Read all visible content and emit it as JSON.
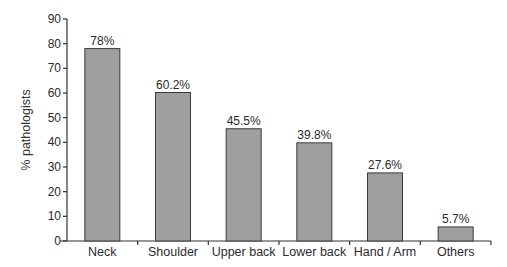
{
  "chart_data": {
    "type": "bar",
    "title": "",
    "xlabel": "",
    "ylabel": "% pathologists",
    "ylim": [
      0,
      90
    ],
    "yticks": [
      0,
      10,
      20,
      30,
      40,
      50,
      60,
      70,
      80,
      90
    ],
    "categories": [
      "Neck",
      "Shoulder",
      "Upper back",
      "Lower back",
      "Hand / Arm",
      "Others"
    ],
    "values": [
      78,
      60.2,
      45.5,
      39.8,
      27.6,
      5.7
    ],
    "data_labels": [
      "78%",
      "60.2%",
      "45.5%",
      "39.8%",
      "27.6%",
      "5.7%"
    ],
    "grid": false,
    "legend": "none",
    "colors": {
      "bar": "#a09f9d",
      "bar_edge": "#3a3a3a",
      "axis": "#333333"
    }
  }
}
